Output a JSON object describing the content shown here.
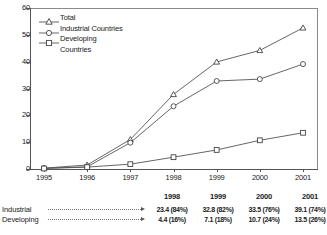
{
  "chart_data": {
    "type": "line",
    "title": "",
    "xlabel": "",
    "ylabel": "",
    "x": [
      "1995",
      "1996",
      "1997",
      "1998",
      "1999",
      "2000",
      "2001"
    ],
    "xlim": [
      1995,
      2001
    ],
    "ylim": [
      0,
      60
    ],
    "yticks": [
      0,
      10,
      20,
      30,
      40,
      50,
      60
    ],
    "grid": false,
    "legend_position": "top-left",
    "series": [
      {
        "name": "Total",
        "marker": "triangle-open",
        "values": [
          0.3,
          1.5,
          11.0,
          27.8,
          39.9,
          44.2,
          52.6
        ]
      },
      {
        "name": "Industrial Countries",
        "marker": "circle-open",
        "values": [
          0.3,
          0.8,
          9.8,
          23.4,
          32.8,
          33.5,
          39.1
        ]
      },
      {
        "name": "Developing Countries",
        "marker": "square-open",
        "values": [
          0.2,
          0.7,
          1.8,
          4.4,
          7.1,
          10.7,
          13.5
        ]
      }
    ]
  },
  "legend": {
    "items": [
      {
        "label": "Total",
        "label2": ""
      },
      {
        "label": "Industrial Countries",
        "label2": ""
      },
      {
        "label": "Developing",
        "label2": "Countries"
      }
    ]
  },
  "axes": {
    "y_ticks": [
      "60",
      "50",
      "40",
      "30",
      "20",
      "10",
      "0"
    ],
    "x_ticks": [
      "1995",
      "1996",
      "1997",
      "1998",
      "1999",
      "2000",
      "2001"
    ]
  },
  "table": {
    "years": [
      "1998",
      "1999",
      "2000",
      "2001"
    ],
    "rows": [
      {
        "label": "Industrial",
        "values": [
          "23.4 (84%)",
          "32.8 (82%)",
          "33.5 (76%)",
          "39.1 (74%)"
        ]
      },
      {
        "label": "Developing",
        "values": [
          "4.4 (16%)",
          "7.1 (18%)",
          "10.7 (24%)",
          "13.5 (26%)"
        ]
      }
    ]
  },
  "colors": {
    "line": "#555555",
    "border": "#8a8a8a",
    "text": "#1a1a1a"
  }
}
